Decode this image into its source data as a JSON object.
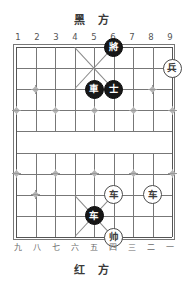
{
  "board": {
    "title_top": "黑 方",
    "title_bottom": "红 方",
    "columns": 9,
    "rows": 10,
    "files_top": [
      "1",
      "2",
      "3",
      "4",
      "5",
      "6",
      "7",
      "8",
      "9"
    ],
    "files_bottom": [
      "九",
      "八",
      "七",
      "六",
      "五",
      "四",
      "三",
      "二",
      "一"
    ],
    "colors": {
      "grid_line": "#777777",
      "board_edge": "#555555",
      "marker": "#9a9a9a",
      "black_piece_fill": "#171717",
      "black_piece_text": "#ffffff",
      "red_piece_fill": "#ffffff",
      "red_piece_text": "#3b3b3b",
      "background": "#ffffff"
    }
  },
  "pieces": [
    {
      "id": "black-general",
      "label": "將",
      "side": "black",
      "col": 6,
      "row": 0
    },
    {
      "id": "red-soldier-right",
      "label": "兵",
      "side": "red",
      "col": 9,
      "row": 1
    },
    {
      "id": "black-chariot-top",
      "label": "車",
      "side": "black",
      "col": 5,
      "row": 2
    },
    {
      "id": "black-advisor",
      "label": "士",
      "side": "black",
      "col": 6,
      "row": 2
    },
    {
      "id": "red-chariot-left",
      "label": "车",
      "side": "red",
      "col": 6,
      "row": 7
    },
    {
      "id": "red-chariot-right",
      "label": "车",
      "side": "red",
      "col": 8,
      "row": 7
    },
    {
      "id": "black-chariot-bot",
      "label": "车",
      "side": "black",
      "col": 5,
      "row": 8
    },
    {
      "id": "red-marshal",
      "label": "帅",
      "side": "red",
      "col": 6,
      "row": 9
    }
  ],
  "markers": [
    {
      "col": 2,
      "row": 2
    },
    {
      "col": 8,
      "row": 2
    },
    {
      "col": 1,
      "row": 3
    },
    {
      "col": 3,
      "row": 3
    },
    {
      "col": 5,
      "row": 3
    },
    {
      "col": 7,
      "row": 3
    },
    {
      "col": 9,
      "row": 3
    },
    {
      "col": 1,
      "row": 6
    },
    {
      "col": 3,
      "row": 6
    },
    {
      "col": 5,
      "row": 6
    },
    {
      "col": 7,
      "row": 6
    },
    {
      "col": 9,
      "row": 6
    },
    {
      "col": 2,
      "row": 7
    },
    {
      "col": 8,
      "row": 7
    }
  ]
}
